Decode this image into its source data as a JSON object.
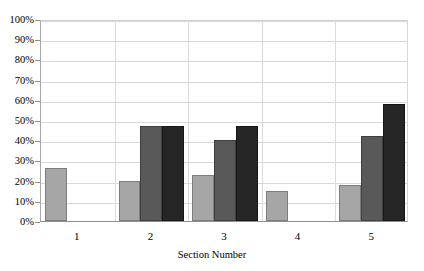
{
  "chart_data": {
    "type": "bar",
    "title": "",
    "xlabel": "Section Number",
    "ylabel": "",
    "categories": [
      "1",
      "2",
      "3",
      "4",
      "5"
    ],
    "ylim": [
      0,
      100
    ],
    "ytick_labels": [
      "0%",
      "10%",
      "20%",
      "30%",
      "40%",
      "50%",
      "60%",
      "70%",
      "80%",
      "90%",
      "100%"
    ],
    "ytick_values": [
      0,
      10,
      20,
      30,
      40,
      50,
      60,
      70,
      80,
      90,
      100
    ],
    "grid": true,
    "legend": "none",
    "value_suffix": "%",
    "series": [
      {
        "name": "series-1",
        "color": "#a6a6a6",
        "border_color": "#7d7d7d",
        "values": [
          26,
          20,
          23,
          15,
          18
        ]
      },
      {
        "name": "series-2",
        "color": "#595959",
        "border_color": "#3f3f3f",
        "values": [
          null,
          47,
          40,
          null,
          42
        ]
      },
      {
        "name": "series-3",
        "color": "#262626",
        "border_color": "#161616",
        "values": [
          null,
          47,
          47,
          null,
          58
        ]
      }
    ]
  },
  "axis": {
    "x_title": "Section Number"
  },
  "title_strip": {
    "text": ""
  }
}
